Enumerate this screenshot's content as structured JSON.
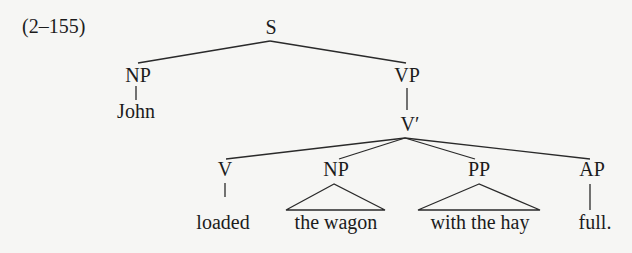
{
  "example_label": "(2–155)",
  "colors": {
    "background": "#f6f6f4",
    "ink": "#1c1c1c"
  },
  "nodes": {
    "S": "S",
    "NP_subject": "NP",
    "VP": "VP",
    "V_bar": "V′",
    "V": "V",
    "NP_object": "NP",
    "PP": "PP",
    "AP": "AP"
  },
  "leaves": {
    "subject": "John",
    "verb": "loaded",
    "object": "the wagon",
    "pp": "with the hay",
    "ap": "full."
  },
  "structure": "[S [NP John] [VP [V′ [V loaded] [NP the wagon] [PP with the hay] [AP full.]]]]"
}
